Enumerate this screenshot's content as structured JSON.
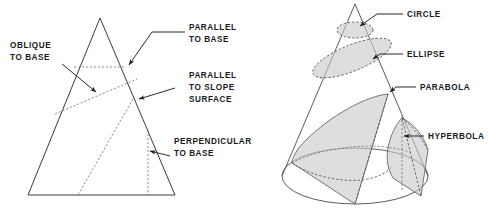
{
  "figure": {
    "background_color": "#ffffff",
    "line_color": "#4a4a4a",
    "plane_fill_color": "#c9c9c9",
    "text_color": "#1a1a1a"
  },
  "left_diagram": {
    "name": "cone-cross-sections-2d",
    "shape": "triangle",
    "labels": [
      {
        "id": "oblique-to-base",
        "line1": "OBLIQUE",
        "line2": "TO BASE",
        "line3": ""
      },
      {
        "id": "parallel-to-base",
        "line1": "PARALLEL",
        "line2": "TO BASE",
        "line3": ""
      },
      {
        "id": "parallel-to-slope",
        "line1": "PARALLEL",
        "line2": "TO SLOPE",
        "line3": "SURFACE"
      },
      {
        "id": "perpendicular-to-base",
        "line1": "PERPENDICULAR",
        "line2": "TO BASE",
        "line3": ""
      }
    ]
  },
  "right_diagram": {
    "name": "conic-sections-3d",
    "shape": "cone",
    "labels": [
      {
        "id": "circle",
        "text": "CIRCLE"
      },
      {
        "id": "ellipse",
        "text": "ELLIPSE"
      },
      {
        "id": "parabola",
        "text": "PARABOLA"
      },
      {
        "id": "hyperbola",
        "text": "HYPERBOLA"
      }
    ]
  }
}
